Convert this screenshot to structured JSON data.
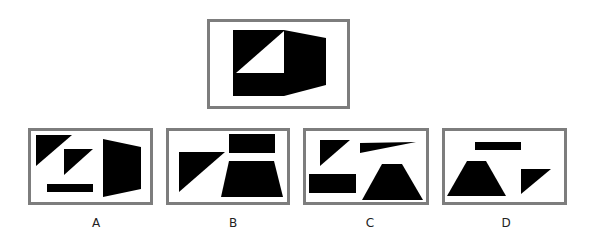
{
  "puzzle": {
    "question_figure": {
      "box": {
        "x": 207,
        "y": 19,
        "w": 143,
        "h": 90
      },
      "shapes": [
        {
          "type": "polygon",
          "fill": "#000000",
          "points": "233,30 284,30 326,38 326,85 284,96 233,96"
        },
        {
          "type": "polygon",
          "fill": "#ffffff",
          "points": "284,31 284,73 236,73"
        }
      ]
    },
    "options": [
      {
        "label": "A",
        "label_x": 96,
        "box": {
          "x": 28,
          "y": 128,
          "w": 125,
          "h": 77
        },
        "shapes": [
          {
            "type": "polygon",
            "fill": "#000000",
            "points": "36,135 72,135 36,166"
          },
          {
            "type": "polygon",
            "fill": "#000000",
            "points": "64,149 93,149 64,175"
          },
          {
            "type": "polygon",
            "fill": "#000000",
            "points": "47,184 93,184 93,192 47,192"
          },
          {
            "type": "polygon",
            "fill": "#000000",
            "points": "103,139 141,147 141,189 103,197"
          }
        ]
      },
      {
        "label": "B",
        "label_x": 233,
        "box": {
          "x": 166,
          "y": 128,
          "w": 124,
          "h": 77
        },
        "shapes": [
          {
            "type": "polygon",
            "fill": "#000000",
            "points": "179,152 225,152 179,192"
          },
          {
            "type": "polygon",
            "fill": "#000000",
            "points": "229,134 275,134 275,153 229,153"
          },
          {
            "type": "polygon",
            "fill": "#000000",
            "points": "229,161 274,161 283,197 221,197"
          }
        ]
      },
      {
        "label": "C",
        "label_x": 370,
        "box": {
          "x": 303,
          "y": 128,
          "w": 126,
          "h": 77
        },
        "shapes": [
          {
            "type": "polygon",
            "fill": "#000000",
            "points": "320,140 350,140 320,166"
          },
          {
            "type": "polygon",
            "fill": "#000000",
            "points": "360,143 416,142 360,153"
          },
          {
            "type": "polygon",
            "fill": "#000000",
            "points": "309,174 356,174 356,193 309,193"
          },
          {
            "type": "polygon",
            "fill": "#000000",
            "points": "382,164 402,164 423,200 362,200"
          }
        ]
      },
      {
        "label": "D",
        "label_x": 506,
        "box": {
          "x": 442,
          "y": 128,
          "w": 125,
          "h": 77
        },
        "shapes": [
          {
            "type": "polygon",
            "fill": "#000000",
            "points": "475,142 521,142 521,150 475,150"
          },
          {
            "type": "polygon",
            "fill": "#000000",
            "points": "467,161 486,161 506,196 447,196"
          },
          {
            "type": "polygon",
            "fill": "#000000",
            "points": "521,169 551,169 521,194"
          }
        ]
      }
    ]
  },
  "colors": {
    "border": "#7d7d7d",
    "shape": "#000000",
    "background": "#ffffff",
    "label": "#222222"
  }
}
